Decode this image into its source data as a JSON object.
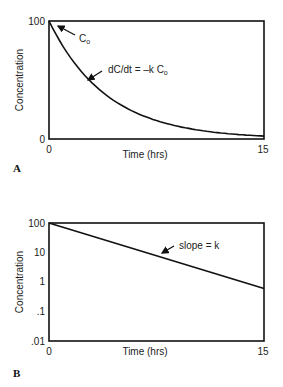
{
  "chart_data": [
    {
      "panel": "A",
      "type": "line",
      "title": "",
      "xlabel": "Time (hrs)",
      "ylabel": "Concentration",
      "xlim": [
        0,
        15
      ],
      "ylim": [
        0,
        100
      ],
      "yscale": "linear",
      "x_ticks": [
        "0",
        "15"
      ],
      "y_ticks": [
        "0",
        "100"
      ],
      "grid": false,
      "series": [
        {
          "name": "first-order decay",
          "x": [
            0,
            1,
            2,
            3,
            4,
            5,
            6,
            7,
            8,
            9,
            10,
            11,
            12,
            13,
            14,
            15
          ],
          "values": [
            100,
            78,
            61,
            47,
            37,
            29,
            22,
            17,
            14,
            11,
            8,
            6,
            5,
            4,
            3,
            2
          ]
        }
      ],
      "annotations": [
        {
          "text": "C",
          "sub": "o",
          "points_to": [
            0,
            100
          ]
        },
        {
          "text": "dC/dt = –k C",
          "sub": "o",
          "points_to": [
            3,
            47
          ]
        }
      ]
    },
    {
      "panel": "B",
      "type": "line",
      "title": "",
      "xlabel": "Time (hrs)",
      "ylabel": "Concentration",
      "xlim": [
        0,
        15
      ],
      "ylim": [
        0.01,
        100
      ],
      "yscale": "log",
      "x_ticks": [
        "0",
        "15"
      ],
      "y_ticks": [
        "100",
        "10",
        "1",
        ".1",
        ".01"
      ],
      "grid": false,
      "series": [
        {
          "name": "log-linear decay",
          "x": [
            0,
            15
          ],
          "values": [
            100,
            0.6
          ]
        }
      ],
      "annotations": [
        {
          "text": "slope = k",
          "points_to": [
            7,
            8
          ]
        }
      ]
    }
  ],
  "panelA": {
    "label": "A",
    "ylabel": "Concentration",
    "xlabel": "Time (hrs)",
    "y_top": "100",
    "y_bottom": "0",
    "x_left": "0",
    "x_right": "15",
    "annot_c0": "C",
    "annot_c0_sub": "o",
    "annot_rate": "dC/dt = –k C",
    "annot_rate_sub": "o"
  },
  "panelB": {
    "label": "B",
    "ylabel": "Concentration",
    "xlabel": "Time (hrs)",
    "y_ticks": [
      "100",
      "10",
      "1",
      ".1",
      ".01"
    ],
    "x_left": "0",
    "x_right": "15",
    "annot_slope": "slope = k"
  },
  "colors": {
    "line": "#111111",
    "axis": "#111111",
    "background": "#ffffff"
  }
}
